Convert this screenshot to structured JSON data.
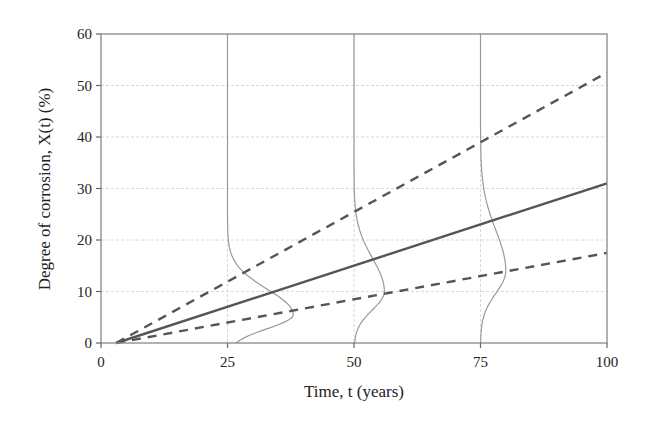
{
  "chart_data": {
    "type": "line",
    "title": "",
    "xlabel": "Time, t (years)",
    "ylabel": "Degree of corrosion, X(t) (%)",
    "xlim": [
      0,
      100
    ],
    "ylim": [
      0,
      60
    ],
    "xticks": [
      0,
      25,
      50,
      75,
      100
    ],
    "yticks": [
      0,
      10,
      20,
      30,
      40,
      50,
      60
    ],
    "grid": true,
    "legend": null,
    "series": [
      {
        "name": "mean",
        "style": "solid",
        "color": "#555555",
        "x": [
          3,
          100
        ],
        "y": [
          0,
          31
        ]
      },
      {
        "name": "upper bound",
        "style": "dashed",
        "color": "#555555",
        "x": [
          3,
          100
        ],
        "y": [
          0,
          52.5
        ]
      },
      {
        "name": "lower bound",
        "style": "dashed",
        "color": "#555555",
        "x": [
          3,
          100
        ],
        "y": [
          0,
          17.5
        ]
      }
    ],
    "distributions": [
      {
        "at_time": 25,
        "peak_value": 5.5,
        "peak_offset_years": 13
      },
      {
        "at_time": 50,
        "peak_value": 10,
        "peak_offset_years": 6
      },
      {
        "at_time": 75,
        "peak_value": 14,
        "peak_offset_years": 5
      }
    ]
  }
}
